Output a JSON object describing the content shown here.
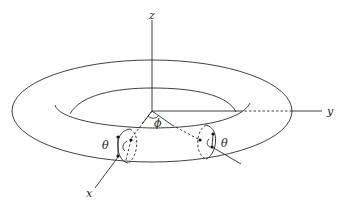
{
  "figure": {
    "axes": {
      "z_label": "z",
      "y_label": "y",
      "x_label": "x"
    },
    "angles": {
      "phi_label": "ϕ",
      "theta_left_label": "θ",
      "theta_right_label": "θ"
    },
    "colors": {
      "line": "#2a2a2a",
      "background": "#ffffff"
    }
  }
}
